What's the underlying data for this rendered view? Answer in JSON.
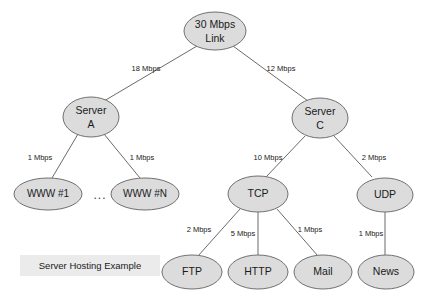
{
  "diagram": {
    "title": "Server Hosting Example",
    "caption": "Server Hosting Example",
    "colors": {
      "node_fill": "#dcdcdc",
      "node_stroke": "#707070",
      "edge_stroke": "#6b6b6b",
      "caption_bg": "#ebebeb",
      "text": "#1a1a1a",
      "background": "#ffffff"
    },
    "ellipsis": "...",
    "nodes": {
      "root": {
        "line1": "30 Mbps",
        "line2": "Link"
      },
      "server_a": {
        "line1": "Server",
        "line2": "A"
      },
      "server_c": {
        "line1": "Server",
        "line2": "C"
      },
      "www_1": {
        "label": "WWW #1"
      },
      "www_n": {
        "label": "WWW #N"
      },
      "tcp": {
        "label": "TCP"
      },
      "udp": {
        "label": "UDP"
      },
      "ftp": {
        "label": "FTP"
      },
      "http": {
        "label": "HTTP"
      },
      "mail": {
        "label": "Mail"
      },
      "news": {
        "label": "News"
      }
    },
    "edges": {
      "root_to_server_a": "18 Mbps",
      "root_to_server_c": "12 Mbps",
      "server_a_to_www_1": "1 Mbps",
      "server_a_to_www_n": "1 Mbps",
      "server_c_to_tcp": "10 Mbps",
      "server_c_to_udp": "2 Mbps",
      "tcp_to_ftp": "2 Mbps",
      "tcp_to_http": "5 Mbps",
      "tcp_to_mail": "1 Mbps",
      "udp_to_news": "1 Mbps"
    }
  }
}
